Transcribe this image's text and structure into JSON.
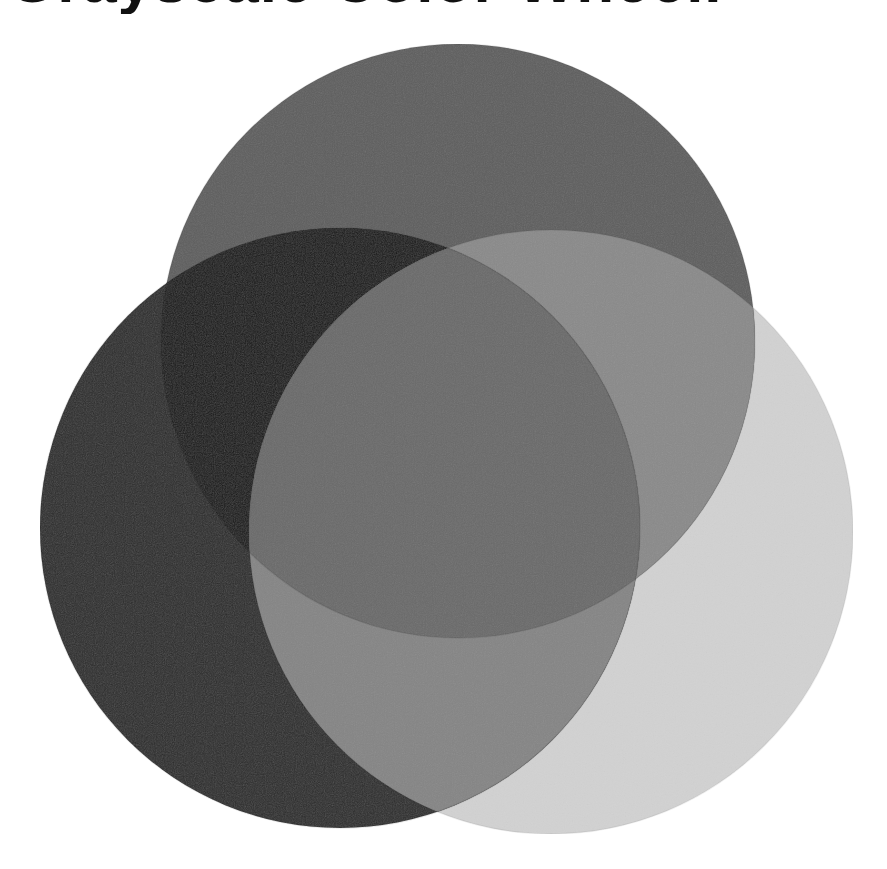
{
  "title": {
    "text": "Grayscale Color Wheel.",
    "visible": "cropped — only bottom edge of letters visible"
  },
  "painting": {
    "description": "Three overlapping painted circles in grayscale values",
    "background": "#ffffff",
    "circles": [
      {
        "name": "top",
        "cx": 458,
        "cy": 341,
        "r": 297,
        "color": "#5f5f5f"
      },
      {
        "name": "left",
        "cx": 340,
        "cy": 528,
        "r": 300,
        "color": "#2e2e2e"
      },
      {
        "name": "right",
        "cx": 551,
        "cy": 532,
        "r": 302,
        "color": "#d2d2d2"
      }
    ],
    "overlaps": {
      "top_left": "#1e1e1e",
      "top_right": "#8a8a8a",
      "left_right": "#858585",
      "center": "#6a6a6a"
    }
  }
}
